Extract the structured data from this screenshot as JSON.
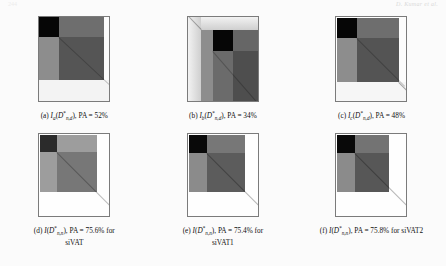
{
  "header": {
    "running_head": "D. Kumar et al.",
    "folio": "244"
  },
  "figure": {
    "panels": [
      {
        "id": "a",
        "label": "(a)",
        "func": "I",
        "func_sub": "a",
        "arg_base": "D",
        "arg_sup": "*",
        "arg_sub": "n,d",
        "metric_name": "PA",
        "metric_value": "52%",
        "caption_plain": "(a) Ia(D*n,d), PA = 52%",
        "suffix": "",
        "image_name": "vat-matrix-a"
      },
      {
        "id": "b",
        "label": "(b)",
        "func": "I",
        "func_sub": "b",
        "arg_base": "D",
        "arg_sup": "*",
        "arg_sub": "n,d",
        "metric_name": "PA",
        "metric_value": "34%",
        "caption_plain": "(b) Ib(D*n,d), PA = 34%",
        "suffix": "",
        "image_name": "vat-matrix-b"
      },
      {
        "id": "c",
        "label": "(c)",
        "func": "I",
        "func_sub": "c",
        "arg_base": "D",
        "arg_sup": "*",
        "arg_sub": "n,d",
        "metric_name": "PA",
        "metric_value": "48%",
        "caption_plain": "(c) Ic(D*n,d), PA = 48%",
        "suffix": "",
        "image_name": "vat-matrix-c"
      },
      {
        "id": "d",
        "label": "(d)",
        "func": "I",
        "func_sub": "",
        "arg_base": "D",
        "arg_sup": "*",
        "arg_sub": "n,n",
        "metric_name": "PA",
        "metric_value": "75.6%",
        "caption_plain": "(d) I(D*n,n), PA = 75.6% for siVAT",
        "suffix": "for siVAT",
        "suffix_word": "siVAT",
        "image_name": "vat-matrix-d"
      },
      {
        "id": "e",
        "label": "(e)",
        "func": "I",
        "func_sub": "",
        "arg_base": "D",
        "arg_sup": "*",
        "arg_sub": "n,n",
        "metric_name": "PA",
        "metric_value": "75.4%",
        "caption_plain": "(e) I(D*n,n), PA = 75.4% for siVAT1",
        "suffix": "for siVAT1",
        "suffix_word": "siVAT1",
        "image_name": "vat-matrix-e"
      },
      {
        "id": "f",
        "label": "(f)",
        "func": "I",
        "func_sub": "",
        "arg_base": "D",
        "arg_sup": "*",
        "arg_sub": "n,n",
        "metric_name": "PA",
        "metric_value": "75.8%",
        "caption_plain": "(f) I(D*n,n), PA = 75.8% for siVAT2",
        "suffix": "for siVAT2",
        "suffix_word": "siVAT2",
        "image_name": "vat-matrix-f"
      }
    ],
    "colors": {
      "black_block": "#060606",
      "dark_gray": "#565656",
      "mid_gray": "#6e6e6e",
      "light_gray": "#9b9b9b",
      "pale_gray": "#c9c9c9",
      "white": "#ffffff",
      "border": "#7b7b7b"
    }
  }
}
